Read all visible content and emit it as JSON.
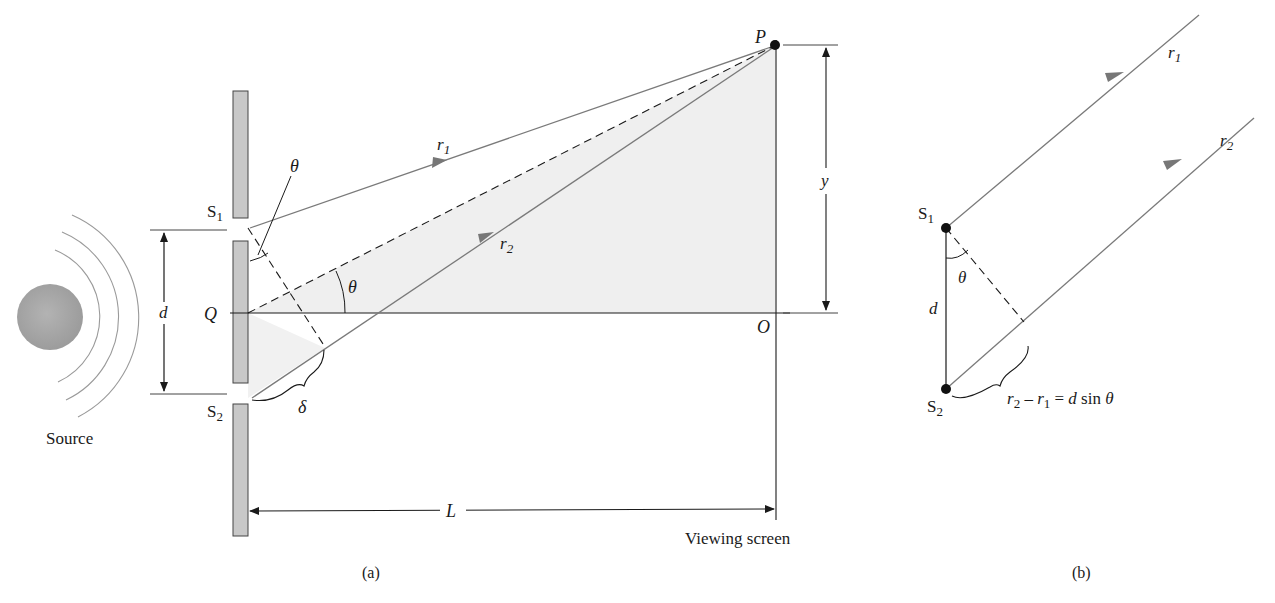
{
  "figure_a": {
    "caption": "(a)",
    "source_label": "Source",
    "slit1_label": "S",
    "slit1_sub": "1",
    "slit2_label": "S",
    "slit2_sub": "2",
    "center_label": "Q",
    "separation_label": "d",
    "path_diff_label": "δ",
    "angle_label_top": "θ",
    "angle_label_mid": "θ",
    "ray1_label": "r",
    "ray1_sub": "1",
    "ray2_label": "r",
    "ray2_sub": "2",
    "point_label": "P",
    "origin_label": "O",
    "height_label": "y",
    "distance_label": "L",
    "screen_label": "Viewing screen"
  },
  "figure_b": {
    "caption": "(b)",
    "slit1_label": "S",
    "slit1_sub": "1",
    "slit2_label": "S",
    "slit2_sub": "2",
    "separation_label": "d",
    "angle_label": "θ",
    "ray1_label": "r",
    "ray1_sub": "1",
    "ray2_label": "r",
    "ray2_sub": "2",
    "formula": {
      "r2": "r",
      "r2_sub": "2",
      "minus": " – ",
      "r1": "r",
      "r1_sub": "1",
      "rest": " = ",
      "d": "d",
      "sin": " sin ",
      "theta": "θ"
    }
  },
  "colors": {
    "barrier_fill": "#c8c8c8",
    "shade_fill": "#efefef",
    "ray": "#7a7a7a",
    "ink": "#1a1a1a",
    "source_fill": "#a9a9a9"
  }
}
